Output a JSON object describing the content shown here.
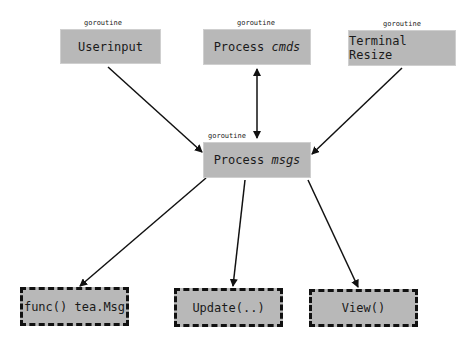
{
  "diagram": {
    "tag": "goroutine",
    "nodes": {
      "userinput": {
        "label": "Userinput"
      },
      "cmds": {
        "prefix": "Process ",
        "em": "cmds"
      },
      "resize": {
        "label": "Terminal Resize"
      },
      "msgs": {
        "prefix": "Process ",
        "em": "msgs"
      },
      "func": {
        "label": "func() tea.Msg"
      },
      "update": {
        "label": "Update(..)"
      },
      "view": {
        "label": "View()"
      }
    },
    "edges": [
      {
        "from": "Userinput",
        "to": "Process msgs"
      },
      {
        "from": "Process cmds",
        "to": "Process msgs",
        "bidirectional": true
      },
      {
        "from": "Terminal Resize",
        "to": "Process msgs"
      },
      {
        "from": "Process msgs",
        "to": "func() tea.Msg"
      },
      {
        "from": "Process msgs",
        "to": "Update(..)"
      },
      {
        "from": "Process msgs",
        "to": "View()"
      }
    ]
  }
}
